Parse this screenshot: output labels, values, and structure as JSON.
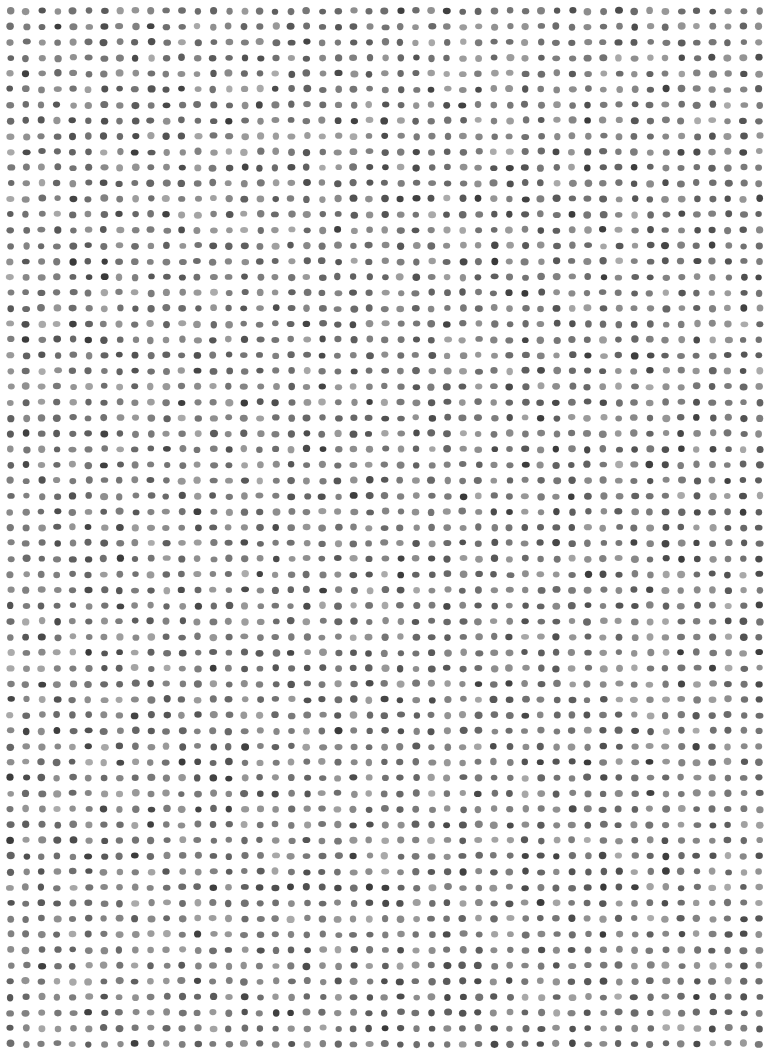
{
  "artwork": {
    "type": "hand-drawn dot grid",
    "background": "#ffffff",
    "grid": {
      "columns": 49,
      "rows": 67,
      "origin_x": 10.5,
      "origin_y": 11,
      "pitch_x": 15.6,
      "pitch_y": 15.65,
      "dot_radius": 3.6
    },
    "dot_colors": [
      "#3a3a3a",
      "#4a4a4a",
      "#555555",
      "#666666",
      "#777777",
      "#888888"
    ]
  }
}
